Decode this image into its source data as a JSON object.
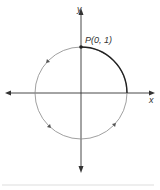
{
  "diagram": {
    "axes": {
      "x_label": "x",
      "y_label": "y"
    },
    "point": {
      "label": "P(0, 1)",
      "coords": [
        0,
        1
      ]
    },
    "direction": "counterclockwise",
    "colors": {
      "stroke": "#333333",
      "circle": "#777777",
      "divider": "#dddddd"
    }
  }
}
